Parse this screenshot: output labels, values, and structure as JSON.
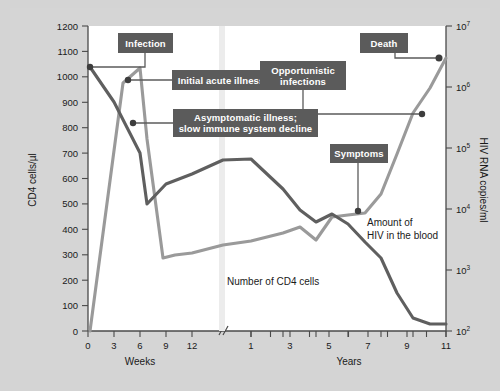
{
  "chart_data": {
    "type": "line",
    "xlabel_left": "Weeks",
    "xlabel_right": "Years",
    "ylabel_left": "CD4 cells/µl",
    "ylabel_right": "HIV RNA copies/ml",
    "y_left_ticks": [
      "0",
      "100",
      "200",
      "300",
      "400",
      "500",
      "600",
      "700",
      "800",
      "900",
      "1000",
      "1100",
      "1200"
    ],
    "y_left_lim": [
      0,
      1200
    ],
    "y_right_ticks": [
      "10²",
      "10³",
      "10⁴",
      "10⁵",
      "10⁶",
      "10⁷"
    ],
    "y_right_tick_base": [
      "10",
      "10",
      "10",
      "10",
      "10",
      "10"
    ],
    "y_right_tick_exp": [
      "2",
      "3",
      "4",
      "5",
      "6",
      "7"
    ],
    "y_right_lim": [
      100,
      10000000
    ],
    "x_ticks_weeks": [
      "0",
      "3",
      "6",
      "9",
      "12"
    ],
    "x_ticks_years": [
      "1",
      "3",
      "5",
      "7",
      "9",
      "11"
    ],
    "axis_break": true,
    "grid": false,
    "legend_position": "inline-annotations",
    "series": [
      {
        "name": "Number of CD4 cells",
        "color": "#5f5f5f",
        "unit": "cells/µl",
        "axis": "left",
        "points": [
          {
            "x": "0 wk",
            "y": 1040
          },
          {
            "x": "3 wk",
            "y": 900
          },
          {
            "x": "6 wk",
            "y": 700
          },
          {
            "x": "7 wk",
            "y": 500
          },
          {
            "x": "9 wk",
            "y": 580
          },
          {
            "x": "12 wk",
            "y": 620
          },
          {
            "x": "1 yr",
            "y": 675
          },
          {
            "x": "2 yr",
            "y": 640
          },
          {
            "x": "3 yr",
            "y": 560
          },
          {
            "x": "4 yr",
            "y": 460
          },
          {
            "x": "5 yr",
            "y": 430
          },
          {
            "x": "6 yr",
            "y": 400
          },
          {
            "x": "7 yr",
            "y": 350
          },
          {
            "x": "8 yr",
            "y": 300
          },
          {
            "x": "9 yr",
            "y": 150
          },
          {
            "x": "10 yr",
            "y": 40
          },
          {
            "x": "11 yr",
            "y": 30
          }
        ]
      },
      {
        "name": "Amount of HIV in the blood",
        "color": "#9a9a9a",
        "unit": "RNA copies/ml",
        "axis": "right",
        "points": [
          {
            "x": "0 wk",
            "y": 100
          },
          {
            "x": "4 wk",
            "y": 700000
          },
          {
            "x": "6 wk",
            "y": 1000000
          },
          {
            "x": "7 wk",
            "y": 300000
          },
          {
            "x": "10 wk",
            "y": 1800
          },
          {
            "x": "12 wk",
            "y": 2000
          },
          {
            "x": "1 yr",
            "y": 3000
          },
          {
            "x": "3 yr",
            "y": 5500
          },
          {
            "x": "4 yr",
            "y": 6500
          },
          {
            "x": "5 yr",
            "y": 4500
          },
          {
            "x": "6 yr",
            "y": 9000
          },
          {
            "x": "7 yr",
            "y": 9500
          },
          {
            "x": "8 yr",
            "y": 20000
          },
          {
            "x": "9 yr",
            "y": 90000
          },
          {
            "x": "10 yr",
            "y": 500000
          },
          {
            "x": "11 yr",
            "y": 2000000
          }
        ]
      }
    ],
    "annotations": [
      {
        "id": "infection",
        "label": "Infection",
        "lines": [
          "Infection"
        ],
        "target_x": "0 wk",
        "target_y": 1040,
        "series": "cd4"
      },
      {
        "id": "initial-acute-illness",
        "label": "Initial acute illness",
        "lines": [
          "Initial acute illness"
        ],
        "target_x": "5 wk",
        "target_y": 980,
        "series": "hiv"
      },
      {
        "id": "asymptomatic-illness",
        "label": "Asymptomatic illness; slow immune system decline",
        "lines": [
          "Asymptomatic illness;",
          "slow immune system decline"
        ],
        "target_x": "7 wk",
        "target_y": 805,
        "series": "hiv"
      },
      {
        "id": "symptoms",
        "label": "Symptoms",
        "lines": [
          "Symptoms"
        ],
        "target_x": "7 yr",
        "target_y": 9500,
        "series": "hiv"
      },
      {
        "id": "opportunistic-infections",
        "label": "Opportunistic infections",
        "lines": [
          "Opportunistic",
          "infections"
        ],
        "target_x": "10 yr",
        "target_y": 450000,
        "series": "hiv"
      },
      {
        "id": "death",
        "label": "Death",
        "lines": [
          "Death"
        ],
        "target_x": "11 yr",
        "target_y": 2000000,
        "series": "hiv"
      }
    ],
    "inline_labels": [
      {
        "id": "hiv-blood-label",
        "lines": [
          "Amount of",
          "HIV in the blood"
        ]
      },
      {
        "id": "cd4-cells-label",
        "lines": [
          "Number of CD4 cells"
        ]
      }
    ],
    "colors": {
      "cd4_line": "#5f5f5f",
      "hiv_line": "#9a9a9a",
      "callout_bg": "#5b5b5b",
      "callout_text": "#ffffff",
      "plot_bg": "#ffffff",
      "figure_bg": "#d5d5d5",
      "axis": "#4a4a4a"
    }
  }
}
